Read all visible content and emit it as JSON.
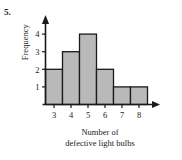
{
  "problem": {
    "number_label": "5."
  },
  "chart_data": {
    "type": "bar",
    "title": "",
    "subtitle": "",
    "xlabel_lines": [
      "Number of",
      "defective light bulbs"
    ],
    "xlabel": "Number of defective light bulbs",
    "ylabel": "Frequency",
    "categories": [
      "3",
      "4",
      "5",
      "6",
      "7",
      "8"
    ],
    "values": [
      2,
      3,
      4,
      2,
      1,
      1
    ],
    "x": [
      3,
      4,
      5,
      6,
      7,
      8
    ],
    "xtick_labels": [
      "3",
      "4",
      "5",
      "6",
      "7",
      "8"
    ],
    "ytick_labels": [
      "1",
      "2",
      "3",
      "4"
    ],
    "yticks": [
      1,
      2,
      3,
      4
    ],
    "ylim": [
      0,
      4.6
    ],
    "xlim": [
      2.5,
      8.5
    ],
    "grid": false,
    "legend": false,
    "legend_position": "none",
    "bin_width": 1,
    "bar_fill_color": "#b9b9b9",
    "bar_edge_color": "#1a1a1a",
    "axis_color": "#1a1a1a",
    "background_color": "#ffffff",
    "axis_arrows": true
  }
}
